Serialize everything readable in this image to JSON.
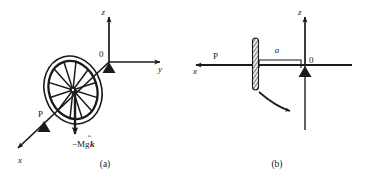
{
  "figure": {
    "title": "",
    "background_color": "#ffffff",
    "ink_color": "#1a1a1a",
    "panels": [
      {
        "id": "a",
        "caption": "(a)",
        "description": "spinning wheel on a pivot with 3D coordinate axes",
        "axes": [
          {
            "name": "z-axis",
            "label": "z",
            "direction": "up"
          },
          {
            "name": "y-axis",
            "label": "y",
            "direction": "right"
          },
          {
            "name": "x-axis",
            "label": "x",
            "direction": "down-left"
          }
        ],
        "origin_label": "0",
        "pivot_label": "P",
        "force_label": "−Mg",
        "force_unit_vector": "k",
        "force_unit_vector_hat": "̂",
        "wheel": {
          "name": "spinning-wheel",
          "spoke_count": 12,
          "rim_count": 2
        }
      },
      {
        "id": "b",
        "caption": "(b)",
        "description": "edge-on view of disk on axle with distance a to pivot and rotation arrow",
        "axes": [
          {
            "name": "z-axis",
            "label": "z",
            "direction": "up"
          },
          {
            "name": "x-axis",
            "label": "x",
            "direction": "left"
          }
        ],
        "origin_label": "0",
        "pivot_label": "P",
        "dimension_label": "a",
        "rotation_arrow": "clockwise-precession"
      }
    ]
  }
}
